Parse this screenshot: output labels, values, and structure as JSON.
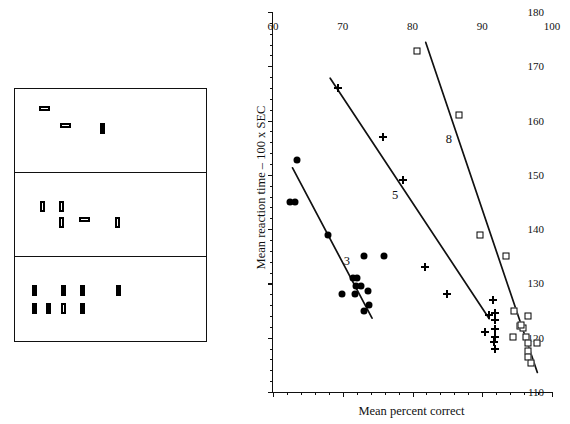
{
  "figure": {
    "stimulus_diagram": {
      "name": "visual-search-display-example",
      "panels": [
        {
          "set_size": 3,
          "items": [
            {
              "orientation": "horizontal",
              "fill": "outlined",
              "x": 24,
              "y": 17
            },
            {
              "orientation": "horizontal",
              "fill": "outlined",
              "x": 45,
              "y": 34
            },
            {
              "orientation": "vertical",
              "fill": "filled",
              "x": 85,
              "y": 34
            }
          ]
        },
        {
          "set_size": 5,
          "items": [
            {
              "orientation": "vertical",
              "fill": "outlined",
              "x": 25,
              "y": 28
            },
            {
              "orientation": "vertical",
              "fill": "outlined",
              "x": 44,
              "y": 28
            },
            {
              "orientation": "vertical",
              "fill": "outlined",
              "x": 44,
              "y": 44
            },
            {
              "orientation": "horizontal",
              "fill": "outlined",
              "x": 64,
              "y": 44
            },
            {
              "orientation": "vertical",
              "fill": "outlined",
              "x": 100,
              "y": 44
            }
          ]
        },
        {
          "set_size": 8,
          "items": [
            {
              "orientation": "vertical",
              "fill": "filled",
              "x": 17,
              "y": 28
            },
            {
              "orientation": "vertical",
              "fill": "filled",
              "x": 46,
              "y": 28
            },
            {
              "orientation": "vertical",
              "fill": "filled",
              "x": 65,
              "y": 28
            },
            {
              "orientation": "vertical",
              "fill": "filled",
              "x": 101,
              "y": 28
            },
            {
              "orientation": "vertical",
              "fill": "filled",
              "x": 17,
              "y": 46
            },
            {
              "orientation": "vertical",
              "fill": "filled",
              "x": 31,
              "y": 46
            },
            {
              "orientation": "vertical",
              "fill": "outlined",
              "x": 46,
              "y": 46
            },
            {
              "orientation": "vertical",
              "fill": "filled",
              "x": 65,
              "y": 46
            }
          ]
        }
      ]
    }
  },
  "chart_data": {
    "type": "scatter",
    "title": "",
    "xlabel": "Mean percent correct",
    "ylabel": "Mean reaction time – 100 x SEC",
    "xlim": [
      60,
      100
    ],
    "ylim": [
      110,
      180
    ],
    "x_ticks": [
      60,
      70,
      80,
      90,
      100
    ],
    "x_tick_labels": [
      "60",
      "70",
      "80",
      "90",
      "100"
    ],
    "x_minor_step": 2,
    "y_ticks": [
      110,
      120,
      130,
      140,
      150,
      160,
      170,
      180
    ],
    "y_tick_labels": [
      "110",
      "120",
      "130",
      "140",
      "150",
      "160",
      "170",
      "180"
    ],
    "y_minor_step": 2,
    "grid": false,
    "legend_position": "inline-annotations",
    "annotations": [
      {
        "text": "3",
        "x": 70.6,
        "y": 134.2
      },
      {
        "text": "5",
        "x": 77.5,
        "y": 146.2
      },
      {
        "text": "8",
        "x": 85.2,
        "y": 156.6
      }
    ],
    "series": [
      {
        "name": "3",
        "label": "3",
        "marker": "circle",
        "color": "#000000",
        "points": [
          {
            "x": 62.4,
            "y": 145.0
          },
          {
            "x": 63.1,
            "y": 145.0
          },
          {
            "x": 63.5,
            "y": 152.8
          },
          {
            "x": 67.9,
            "y": 139.0
          },
          {
            "x": 69.9,
            "y": 128.0
          },
          {
            "x": 71.4,
            "y": 131.0
          },
          {
            "x": 72.1,
            "y": 131.0
          },
          {
            "x": 71.9,
            "y": 129.6
          },
          {
            "x": 72.6,
            "y": 129.6
          },
          {
            "x": 71.8,
            "y": 128.0
          },
          {
            "x": 73.0,
            "y": 135.0
          },
          {
            "x": 73.6,
            "y": 128.6
          },
          {
            "x": 73.0,
            "y": 125.0
          },
          {
            "x": 73.8,
            "y": 126.0
          },
          {
            "x": 75.9,
            "y": 135.0
          }
        ],
        "fit_line": {
          "x1": 62.8,
          "y1": 151.3,
          "x2": 74.2,
          "y2": 123.6
        }
      },
      {
        "name": "5",
        "label": "5",
        "marker": "plus",
        "color": "#000000",
        "points": [
          {
            "x": 69.3,
            "y": 166.0
          },
          {
            "x": 75.7,
            "y": 157.0
          },
          {
            "x": 78.7,
            "y": 149.0
          },
          {
            "x": 81.8,
            "y": 133.0
          },
          {
            "x": 85.0,
            "y": 128.0
          },
          {
            "x": 90.4,
            "y": 121.0
          },
          {
            "x": 91.6,
            "y": 127.0
          },
          {
            "x": 91.0,
            "y": 124.2
          },
          {
            "x": 91.8,
            "y": 124.6
          },
          {
            "x": 91.8,
            "y": 123.2
          },
          {
            "x": 91.8,
            "y": 121.6
          },
          {
            "x": 91.8,
            "y": 120.2
          },
          {
            "x": 91.7,
            "y": 119.2
          },
          {
            "x": 91.8,
            "y": 118.0
          }
        ],
        "fit_line": {
          "x1": 68.2,
          "y1": 167.8,
          "x2": 91.0,
          "y2": 123.5
        }
      },
      {
        "name": "8",
        "label": "8",
        "marker": "square",
        "color": "#000000",
        "points": [
          {
            "x": 80.7,
            "y": 172.8
          },
          {
            "x": 86.6,
            "y": 161.0
          },
          {
            "x": 89.7,
            "y": 139.0
          },
          {
            "x": 93.4,
            "y": 135.0
          },
          {
            "x": 94.5,
            "y": 125.0
          },
          {
            "x": 94.4,
            "y": 120.2
          },
          {
            "x": 95.4,
            "y": 122.2
          },
          {
            "x": 95.8,
            "y": 121.8
          },
          {
            "x": 95.6,
            "y": 122.4
          },
          {
            "x": 96.3,
            "y": 120.2
          },
          {
            "x": 96.6,
            "y": 124.0
          },
          {
            "x": 96.6,
            "y": 119.0
          },
          {
            "x": 96.6,
            "y": 117.6
          },
          {
            "x": 96.6,
            "y": 116.4
          },
          {
            "x": 97.0,
            "y": 115.4
          },
          {
            "x": 97.8,
            "y": 119.0
          }
        ],
        "fit_line": {
          "x1": 81.9,
          "y1": 174.4,
          "x2": 97.9,
          "y2": 113.6
        }
      }
    ]
  }
}
